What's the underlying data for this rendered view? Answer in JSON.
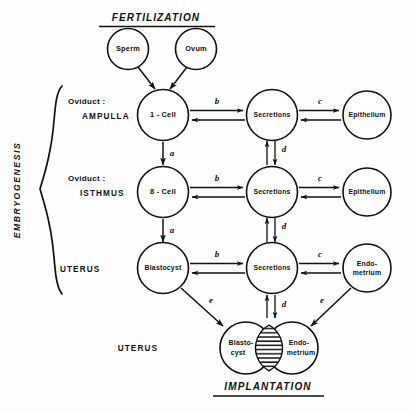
{
  "figure": {
    "title_top": "FERTILIZATION",
    "title_bottom": "IMPLANTATION",
    "brace_label": "EMBRYOGENESIS"
  },
  "rows": [
    {
      "id": "ampulla",
      "label_line1": "Oviduct :",
      "label_line2": "AMPULLA",
      "embryo": "1 - Cell",
      "middle": "Secretions",
      "tissue": "Epithelium"
    },
    {
      "id": "isthmus",
      "label_line1": "Oviduct :",
      "label_line2": "ISTHMUS",
      "embryo": "8 - Cell",
      "middle": "Secretions",
      "tissue": "Epithelium"
    },
    {
      "id": "uterus",
      "label_line1": "",
      "label_line2": "UTERUS",
      "embryo": "Blastocyst",
      "middle": "Secretions",
      "tissue_line1": "Endo-",
      "tissue_line2": "metrium"
    }
  ],
  "gametes": [
    {
      "label": "Sperm"
    },
    {
      "label": "Ovum"
    }
  ],
  "implantation": {
    "row_label": "UTERUS",
    "left_line1": "Blasto-",
    "left_line2": "cyst",
    "right_line1": "Endo-",
    "right_line2": "metrium"
  },
  "arrow_labels": {
    "horizontal_embryo_to_secretions": "b",
    "horizontal_secretions_to_tissue": "c",
    "vertical_stage": "a",
    "vertical_secretions": "d",
    "diagonal_implantation": "e"
  },
  "colors": {
    "ink": "#111111",
    "paper": "#ffffff"
  }
}
